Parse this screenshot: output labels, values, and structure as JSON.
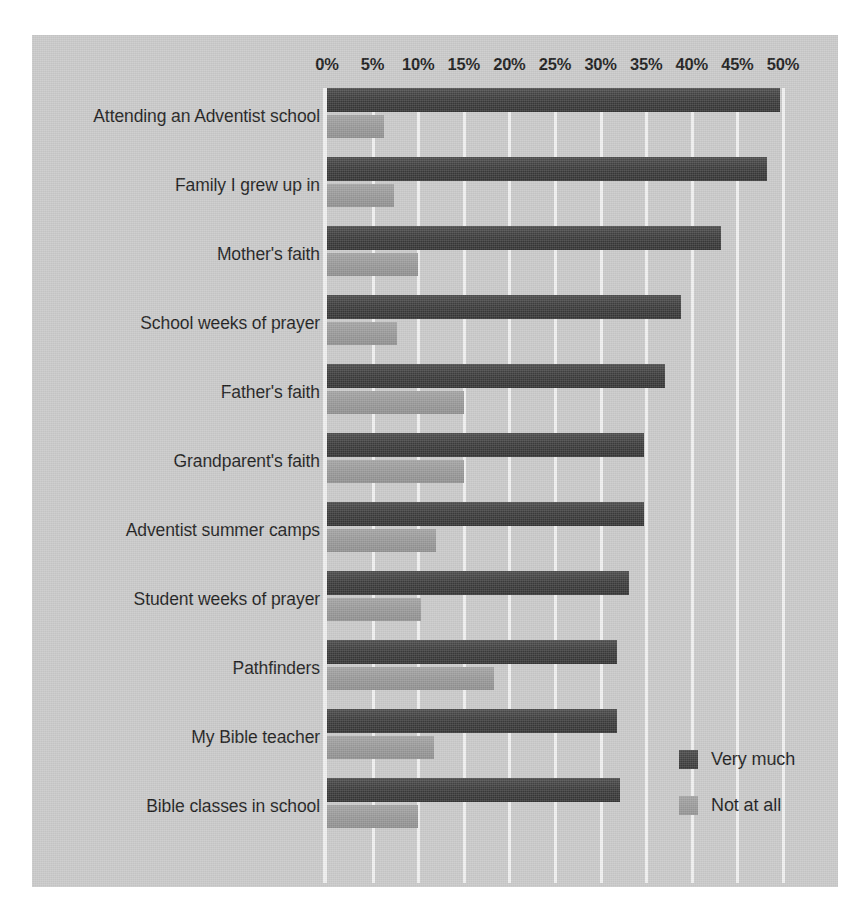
{
  "chart_data": {
    "type": "bar",
    "orientation": "horizontal",
    "title": "",
    "subtitle": "",
    "xlabel": "",
    "ylabel": "",
    "xlim": [
      0,
      50
    ],
    "xtick_labels": [
      "0%",
      "5%",
      "10%",
      "15%",
      "20%",
      "25%",
      "30%",
      "35%",
      "40%",
      "45%",
      "50%"
    ],
    "xtick_values": [
      0,
      5,
      10,
      15,
      20,
      25,
      30,
      35,
      40,
      45,
      50
    ],
    "grid": true,
    "grid_axis": "x",
    "legend_position": "bottom-right",
    "categories": [
      "Attending an Adventist school",
      "Family I grew up in",
      "Mother's faith",
      "School weeks of prayer",
      "Father's faith",
      "Grandparent's faith",
      "Adventist summer camps",
      "Student weeks of prayer",
      "Pathfinders",
      "My Bible teacher",
      "Bible classes in school"
    ],
    "series": [
      {
        "name": "Very much",
        "color": "#3d3d3d",
        "values": [
          49.7,
          48.2,
          43.2,
          38.8,
          37.1,
          34.8,
          34.8,
          33.1,
          31.8,
          31.8,
          32.1
        ]
      },
      {
        "name": "Not at all",
        "color": "#999999",
        "values": [
          6.3,
          7.3,
          10.0,
          7.7,
          15.0,
          15.0,
          11.9,
          10.3,
          18.3,
          11.7,
          10.0
        ]
      }
    ]
  },
  "legend": {
    "items": [
      {
        "label": "Very much"
      },
      {
        "label": "Not at all"
      }
    ]
  },
  "colors": {
    "panel_background": "#c9c9c9",
    "gridline": "#f0f0f0",
    "very_much": "#3d3d3d",
    "not_at_all": "#999999",
    "text": "#1c1c1c"
  }
}
